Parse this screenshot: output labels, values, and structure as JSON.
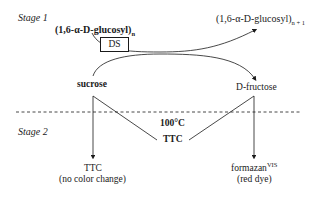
{
  "stage1": {
    "label": "Stage 1"
  },
  "stage2": {
    "label": "Stage 2"
  },
  "reactant_polymer": {
    "prefix": "(1,6-α-",
    "d": "D",
    "suffix": "-glucosyl)",
    "subscript": "n"
  },
  "product_polymer": {
    "prefix": "(1,6-α-",
    "d": "D",
    "suffix": "-glucosyl)",
    "subscript": "n + 1"
  },
  "enzyme": {
    "label": "DS"
  },
  "sucrose": {
    "label": "sucrose"
  },
  "fructose": {
    "d": "D",
    "label": "-fructose"
  },
  "condition": {
    "temperature": "100°C",
    "reagent": "TTC"
  },
  "left_result": {
    "line1": "TTC",
    "line2": "(no color change)"
  },
  "right_result": {
    "line1": "formazan",
    "superscript": "VIS",
    "line2": "(red dye)"
  },
  "colors": {
    "ink": "#1a1a1a",
    "background": "#ffffff"
  }
}
